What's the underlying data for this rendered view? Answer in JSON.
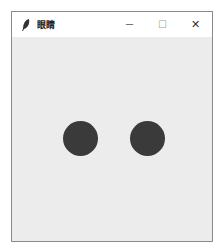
{
  "window": {
    "title": "眼睛",
    "icon": "feather-icon",
    "controls": {
      "minimize": "—",
      "maximize": "☐",
      "close": "✕"
    }
  },
  "canvas": {
    "background": "#ececec",
    "eyes": [
      {
        "name": "left-eye",
        "cx": 68,
        "cy": 101,
        "diameter": 35,
        "color": "#3a3a3a"
      },
      {
        "name": "right-eye",
        "cx": 135,
        "cy": 101,
        "diameter": 35,
        "color": "#3a3a3a"
      }
    ]
  }
}
